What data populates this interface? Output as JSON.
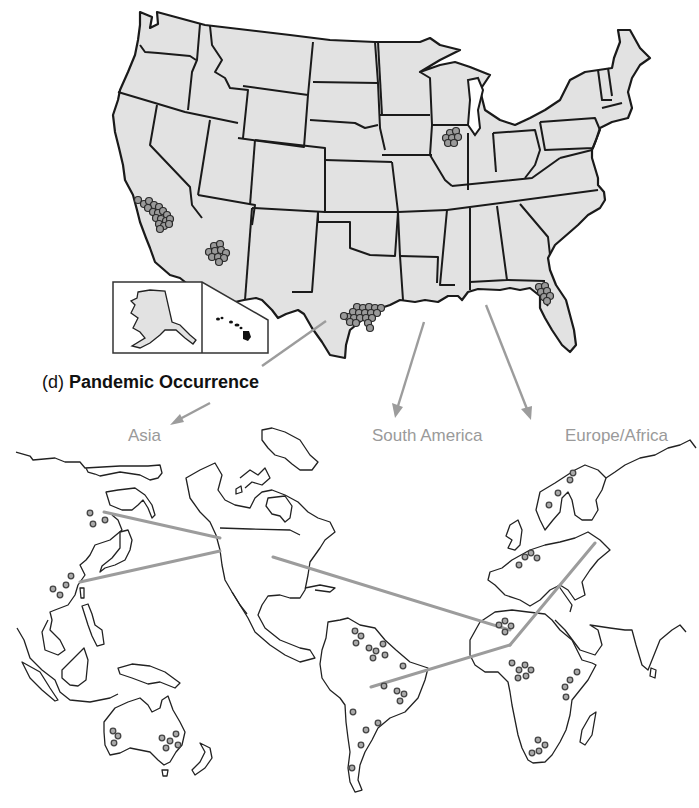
{
  "figure": {
    "caption_prefix": "(d)",
    "caption_title": "Pandemic Occurrence",
    "regions": {
      "asia": "Asia",
      "south_america": "South America",
      "europe_africa": "Europe/Africa"
    },
    "colors": {
      "state_fill": "#e2e2e2",
      "state_border": "#1a1a1a",
      "arrow_gray": "#9c9c9c",
      "label_gray": "#9a9a9a",
      "dot_fill": "#9a9a9a"
    },
    "us_map": {
      "insets": [
        "Alaska",
        "Hawaii"
      ],
      "clusters": [
        {
          "location": "Southern California",
          "dot_count": 18
        },
        {
          "location": "Southern Arizona",
          "dot_count": 10
        },
        {
          "location": "South Texas",
          "dot_count": 20
        },
        {
          "location": "Northern Illinois",
          "dot_count": 7
        },
        {
          "location": "Northeast Florida",
          "dot_count": 7
        }
      ]
    },
    "world_map": {
      "routes": [
        "North America to Asia (north)",
        "North America to Asia (south)",
        "North America to Africa",
        "South America to Africa",
        "Africa to Europe"
      ],
      "occurrence_regions": [
        {
          "region": "East Asia",
          "dot_count": 7
        },
        {
          "region": "Australia",
          "dot_count": 8
        },
        {
          "region": "South America",
          "dot_count": 20
        },
        {
          "region": "Northern Europe",
          "dot_count": 4
        },
        {
          "region": "Western Europe",
          "dot_count": 4
        },
        {
          "region": "North Africa",
          "dot_count": 4
        },
        {
          "region": "Central Africa",
          "dot_count": 6
        },
        {
          "region": "East Africa",
          "dot_count": 4
        },
        {
          "region": "Southern Africa",
          "dot_count": 4
        }
      ]
    }
  }
}
